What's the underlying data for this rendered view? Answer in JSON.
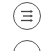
{
  "toolbar": {
    "buttons": [
      {
        "icon": "list-arrows-icon",
        "label": ""
      },
      {
        "icon": "circle-button-icon",
        "label": ""
      }
    ],
    "colors": {
      "stroke": "#555555",
      "background": "#ffffff"
    }
  }
}
